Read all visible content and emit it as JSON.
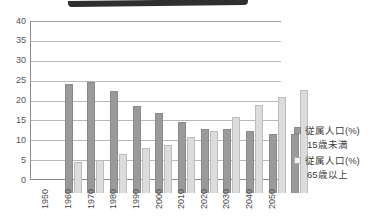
{
  "top_band": {
    "name": "cropped-dark-banner"
  },
  "chart_data": {
    "type": "bar",
    "title": "",
    "subtitle": "",
    "xlabel": "",
    "ylabel": "",
    "ylim": [
      0,
      40
    ],
    "ytick_values": [
      40,
      35,
      30,
      25,
      20,
      15,
      10,
      5,
      0
    ],
    "ytick_labels": [
      "40",
      "35",
      "30",
      "25",
      "20",
      "15",
      "10",
      "5",
      "0"
    ],
    "grid": true,
    "grid_axis": "y",
    "legend_position": "right",
    "categories": [
      "1950",
      "1960",
      "1970",
      "1980",
      "1990",
      "2000",
      "2010",
      "2020",
      "2030",
      "2040",
      "2050"
    ],
    "series": [
      {
        "name": "従属人口(%)\n15歳未満",
        "label_line1": "従属人口(%)",
        "label_line2": "15歳未満",
        "color": "#9a9a9a",
        "values": [
          27.3,
          28.0,
          25.6,
          22.0,
          20.2,
          17.8,
          16.0,
          16.0,
          15.5,
          14.8,
          14.9
        ]
      },
      {
        "name": "従属人口(%)\n65歳以上",
        "label_line1": "従属人口(%)",
        "label_line2": "65歳以上",
        "color": "#dcdcdc",
        "values": [
          7.8,
          8.2,
          9.7,
          11.3,
          12.0,
          14.0,
          15.5,
          19.0,
          22.2,
          24.2,
          25.8
        ]
      }
    ]
  },
  "colors": {
    "series_younger": "#9a9a9a",
    "series_older": "#dcdcdc",
    "gridline": "#b9b9b9",
    "axis": "#8c8c8c",
    "tick_text": "#555555",
    "banner": "#2f2f2f"
  }
}
